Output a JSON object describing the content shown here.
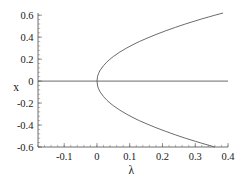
{
  "chart_data": {
    "type": "line",
    "title": "",
    "subtitle": "",
    "xlabel": "λ",
    "ylabel": "x",
    "xlim": [
      -0.18,
      0.4
    ],
    "ylim": [
      -0.6,
      0.62
    ],
    "grid": false,
    "legend": null,
    "x_ticks": [
      -0.1,
      0,
      0.1,
      0.2,
      0.3,
      0.4
    ],
    "x_tick_labels": [
      "-0.1",
      "0",
      "0.1",
      "0.2",
      "0.3",
      "0.4"
    ],
    "y_ticks": [
      -0.6,
      -0.4,
      -0.2,
      0,
      0.2,
      0.4,
      0.6
    ],
    "y_tick_labels": [
      "-0.6",
      "-0.4",
      "-0.2",
      "0",
      "0.2",
      "0.4",
      "0.6"
    ],
    "x_minor_step": 0.02,
    "y_minor_step": 0.04,
    "series": [
      {
        "name": "trivial-branch",
        "style": "solid",
        "color": "#5a5a5a",
        "comment": "horizontal line x = 0",
        "points": [
          [
            -0.18,
            0.0
          ],
          [
            0.4,
            0.0
          ]
        ]
      },
      {
        "name": "upper-branch",
        "style": "solid",
        "color": "#5a5a5a",
        "comment": "x = +sqrt(lambda)",
        "points": [
          [
            0.0,
            0.0
          ],
          [
            0.002,
            0.045
          ],
          [
            0.005,
            0.071
          ],
          [
            0.01,
            0.1
          ],
          [
            0.02,
            0.141
          ],
          [
            0.03,
            0.173
          ],
          [
            0.04,
            0.2
          ],
          [
            0.05,
            0.224
          ],
          [
            0.07,
            0.265
          ],
          [
            0.09,
            0.3
          ],
          [
            0.11,
            0.332
          ],
          [
            0.13,
            0.361
          ],
          [
            0.15,
            0.387
          ],
          [
            0.18,
            0.424
          ],
          [
            0.21,
            0.458
          ],
          [
            0.24,
            0.49
          ],
          [
            0.27,
            0.52
          ],
          [
            0.3,
            0.548
          ],
          [
            0.32,
            0.566
          ],
          [
            0.34,
            0.583
          ],
          [
            0.36,
            0.6
          ],
          [
            0.375,
            0.612
          ],
          [
            0.385,
            0.62
          ]
        ]
      },
      {
        "name": "lower-branch",
        "style": "solid",
        "color": "#5a5a5a",
        "comment": "x = -sqrt(lambda)",
        "points": [
          [
            0.0,
            0.0
          ],
          [
            0.002,
            -0.045
          ],
          [
            0.005,
            -0.071
          ],
          [
            0.01,
            -0.1
          ],
          [
            0.02,
            -0.141
          ],
          [
            0.03,
            -0.173
          ],
          [
            0.04,
            -0.2
          ],
          [
            0.05,
            -0.224
          ],
          [
            0.07,
            -0.265
          ],
          [
            0.09,
            -0.3
          ],
          [
            0.11,
            -0.332
          ],
          [
            0.13,
            -0.361
          ],
          [
            0.15,
            -0.387
          ],
          [
            0.18,
            -0.424
          ],
          [
            0.21,
            -0.458
          ],
          [
            0.24,
            -0.49
          ],
          [
            0.27,
            -0.52
          ],
          [
            0.3,
            -0.548
          ],
          [
            0.32,
            -0.566
          ],
          [
            0.34,
            -0.583
          ],
          [
            0.355,
            -0.596
          ],
          [
            0.36,
            -0.6
          ]
        ]
      }
    ]
  }
}
